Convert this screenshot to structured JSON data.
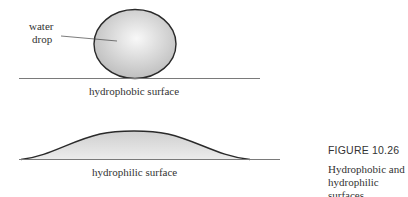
{
  "figure": {
    "number_label": "FIGURE 10.26",
    "caption_line1": "Hydrophobic and",
    "caption_line2": "hydrophilic surfaces."
  },
  "top_diagram": {
    "drop_label_line1": "water",
    "drop_label_line2": "drop",
    "surface_label": "hydrophobic surface"
  },
  "bottom_diagram": {
    "surface_label": "hydrophilic surface"
  },
  "colors": {
    "outline": "#2a2a2a",
    "surface_line": "#6a6a6a",
    "drop_fill_center": "#f8f8f8",
    "drop_fill_edge": "#bdbdbd",
    "text": "#333333"
  }
}
